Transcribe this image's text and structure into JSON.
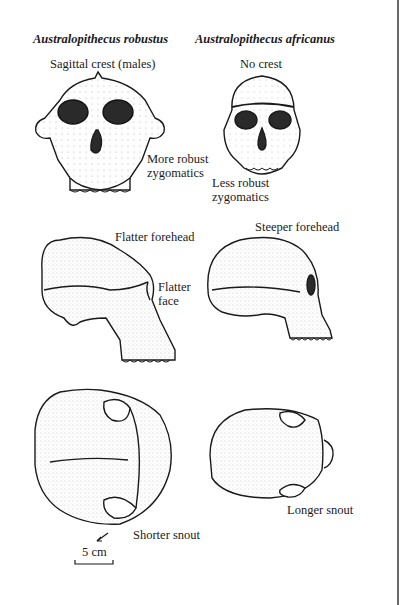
{
  "columns": [
    {
      "species": "Australopithecus robustus"
    },
    {
      "species": "Australopithecus africanus"
    }
  ],
  "annotations": {
    "robustus_front_top": "Sagittal crest (males)",
    "robustus_front_side_1": "More robust",
    "robustus_front_side_2": "zygomatics",
    "africanus_front_top": "No crest",
    "africanus_front_side_1": "Less robust",
    "africanus_front_side_2": "zygomatics",
    "robustus_lateral_top": "Flatter forehead",
    "robustus_lateral_side_1": "Flatter",
    "robustus_lateral_side_2": "face",
    "africanus_lateral_top": "Steeper forehead",
    "robustus_top_view": "Shorter snout",
    "africanus_top_view": "Longer snout"
  },
  "scale_bar": {
    "label": "5 cm"
  },
  "views": [
    "front view",
    "lateral view",
    "top view"
  ],
  "colors": {
    "ink": "#1a1a1a",
    "background": "#ffffff",
    "frame": "#6a6a6a"
  }
}
